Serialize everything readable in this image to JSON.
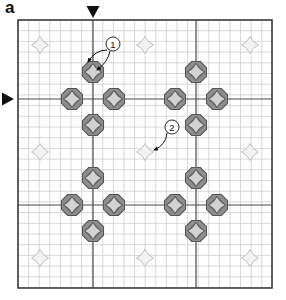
{
  "figure": {
    "panel_label": "a",
    "type": "electron-diffraction-pattern-schematic"
  },
  "colors": {
    "background": "#ffffff",
    "plot_border": "#3c3c3c",
    "minor_grid": "#c9c9c9",
    "major_grid": "#4a4a4a",
    "strong_spot_fill": "#8e8e8e",
    "strong_spot_stroke": "#555555",
    "strong_spot_inner": "#d2d2d2",
    "weak_spot_fill": "#f2f2f2",
    "weak_spot_stroke": "#b8b8b8",
    "marker": "#111111",
    "annotation": "#111111"
  },
  "plot": {
    "left": 18,
    "top": 20,
    "right": 272,
    "bottom": 288,
    "minor_grid_step_x": 10.6,
    "minor_grid_step_y": 10.7,
    "major_grid_x": [
      93,
      196
    ],
    "major_grid_y": [
      99,
      205
    ]
  },
  "markers": {
    "top_triangle": {
      "name": "down-triangle-marker",
      "x": 93,
      "y": 12,
      "direction": "down"
    },
    "left_triangle": {
      "name": "right-triangle-marker",
      "x": 8,
      "y": 99,
      "direction": "right"
    }
  },
  "annotations": [
    {
      "id": "1",
      "label": "1",
      "circle": {
        "cx": 113,
        "cy": 44,
        "r": 7
      },
      "arrows": [
        {
          "from_x": 107,
          "from_y": 50,
          "to_x": 88,
          "to_y": 62,
          "ctrl_x": 95,
          "ctrl_y": 50
        },
        {
          "from_x": 110,
          "from_y": 51,
          "to_x": 97,
          "to_y": 70,
          "ctrl_x": 108,
          "ctrl_y": 62
        }
      ]
    },
    {
      "id": "2",
      "label": "2",
      "circle": {
        "cx": 172,
        "cy": 127,
        "r": 7
      },
      "arrows": [
        {
          "from_x": 167,
          "from_y": 133,
          "to_x": 154,
          "to_y": 150,
          "ctrl_x": 166,
          "ctrl_y": 145
        }
      ]
    }
  ],
  "chart_data": {
    "type": "scatter",
    "title": "",
    "xlabel": "",
    "ylabel": "",
    "grid": true,
    "legend": null,
    "xlim": [
      18,
      272
    ],
    "ylim": [
      20,
      288
    ],
    "series": [
      {
        "name": "strong diffraction spots",
        "marker": "octagon-with-inner-star",
        "size": 21,
        "points": [
          [
            93,
            72
          ],
          [
            72,
            99
          ],
          [
            114,
            99
          ],
          [
            93,
            125
          ],
          [
            196,
            72
          ],
          [
            175,
            99
          ],
          [
            217,
            99
          ],
          [
            196,
            125
          ],
          [
            93,
            178
          ],
          [
            72,
            205
          ],
          [
            114,
            205
          ],
          [
            93,
            231
          ],
          [
            196,
            178
          ],
          [
            175,
            205
          ],
          [
            217,
            205
          ],
          [
            196,
            231
          ]
        ]
      },
      {
        "name": "weak diffraction spots",
        "marker": "four-point-star",
        "size": 17,
        "points": [
          [
            40,
            45
          ],
          [
            145,
            45
          ],
          [
            250,
            45
          ],
          [
            40,
            152
          ],
          [
            145,
            152
          ],
          [
            250,
            152
          ],
          [
            40,
            258
          ],
          [
            145,
            258
          ],
          [
            250,
            258
          ]
        ]
      }
    ]
  }
}
